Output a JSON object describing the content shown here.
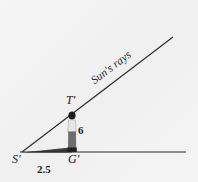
{
  "figure": {
    "background_color": "#f2f2f2",
    "ink_color": "#262626",
    "labels": {
      "sun_rays": "Sun's rays",
      "top_point": "T'",
      "shadow_tip": "S'",
      "ground_point": "G'",
      "height": "6",
      "shadow_length": "2.5"
    },
    "person": {
      "head_color": "#1f1f1f",
      "shirt_color": "#e3e3e3",
      "trouser_color": "#6b6b6b",
      "shoe_color": "#1f1f1f"
    },
    "geometry": {
      "ray_start": [
        22,
        152
      ],
      "ray_end": [
        173,
        37
      ],
      "ground_start": [
        20,
        152
      ],
      "ground_end": [
        186,
        152
      ],
      "vertical_x": 72,
      "vertical_top": 113,
      "vertical_bottom": 152,
      "angle_degrees": 37.3
    }
  }
}
